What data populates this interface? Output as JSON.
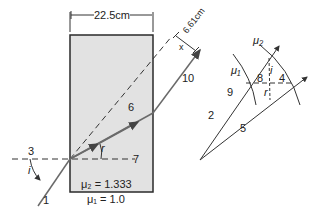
{
  "diagram": {
    "type": "refraction-through-slab",
    "colors": {
      "slab_fill": "#e2e2e2",
      "slab_border": "#2a2a2a",
      "ray": "#555555",
      "line": "#333333"
    },
    "slab": {
      "width_label": "22.5cm",
      "offset_label": "6.61cm",
      "offset_symbol": "x",
      "medium_inside_label": "μ₂ = 1.333",
      "medium_outside_label": "μ₁ = 1.0"
    },
    "ray_labels": {
      "incident": "1",
      "normal_left": "3",
      "refracted": "6",
      "normal_right": "7",
      "emergent": "10",
      "angle_i": "i",
      "angle_r": "r"
    },
    "vector_diagram": {
      "mu2_label": "μ₂",
      "mu1_label": "μ₁",
      "labels": {
        "l2": "2",
        "l4": "4",
        "l5": "5",
        "l8": "8",
        "l9": "9"
      },
      "angle_i": "i",
      "angle_r": "r"
    }
  }
}
